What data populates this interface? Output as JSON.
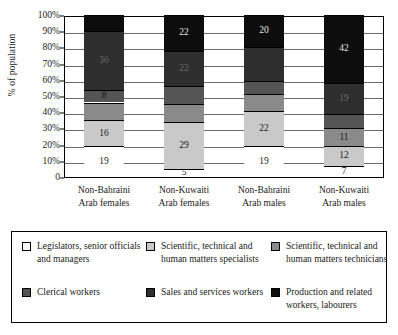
{
  "chart_data": {
    "type": "bar",
    "subtype": "100% stacked column",
    "title": "",
    "xlabel": "",
    "ylabel": "% of population",
    "ylim": [
      0,
      100
    ],
    "yticks": [
      "0",
      "10%",
      "20%",
      "30%",
      "40%",
      "50%",
      "60%",
      "70%",
      "80%",
      "90%",
      "100%"
    ],
    "ytick_values": [
      0,
      10,
      20,
      30,
      40,
      50,
      60,
      70,
      80,
      90,
      100
    ],
    "grid": true,
    "legend_position": "bottom",
    "categories": [
      "Non-Bahraini Arab females",
      "Non-Kuwaiti Arab females",
      "Non-Bahraini Arab males",
      "Non-Kuwaiti Arab males"
    ],
    "category_lines": [
      [
        "Non-Bahraini",
        "Arab females"
      ],
      [
        "Non-Kuwaiti",
        "Arab females"
      ],
      [
        "Non-Bahraini",
        "Arab males"
      ],
      [
        "Non-Kuwaiti",
        "Arab males"
      ]
    ],
    "series": [
      {
        "name": "Legislators, senior officials and managers",
        "color": "#ffffff",
        "label_color": "#1a1a1a",
        "values": [
          19,
          5,
          19,
          7
        ]
      },
      {
        "name": "Scientific, technical and human matters specialists",
        "color": "#c9c9c9",
        "label_color": "#1a1a1a",
        "values": [
          16,
          29,
          22,
          12
        ]
      },
      {
        "name": "Scientific, technical and human matters technicians",
        "color": "#8a8a8a",
        "label_color": "#1a1a1a",
        "values": [
          11,
          11,
          10,
          11
        ]
      },
      {
        "name": "Clerical workers",
        "color": "#545454",
        "label_color": "#1a1a1a",
        "values": [
          8,
          11,
          8,
          9
        ]
      },
      {
        "name": "Sales and services workers",
        "color": "#2e2e2e",
        "label_color": "#6a6a6a",
        "values": [
          36,
          22,
          21,
          19
        ]
      },
      {
        "name": "Production and related workers, labourers",
        "color": "#0d0d0d",
        "label_color": "#e8e8e8",
        "values": [
          10,
          22,
          20,
          42
        ]
      }
    ],
    "visible_value_labels": {
      "Non-Bahraini Arab females": {
        "Legislators, senior officials and managers": "19",
        "Scientific, technical and human matters specialists": "16",
        "Clerical workers": "8",
        "Sales and services workers": "36"
      },
      "Non-Kuwaiti Arab females": {
        "Legislators, senior officials and managers": "5",
        "Scientific, technical and human matters specialists": "29",
        "Sales and services workers": "22",
        "Production and related workers, labourers": "22"
      },
      "Non-Bahraini Arab males": {
        "Legislators, senior officials and managers": "19",
        "Scientific, technical and human matters specialists": "22",
        "Production and related workers, labourers": "20"
      },
      "Non-Kuwaiti Arab males": {
        "Legislators, senior officials and managers": "7",
        "Scientific, technical and human matters specialists": "12",
        "Scientific, technical and human matters technicians": "11",
        "Sales and services workers": "19",
        "Production and related workers, labourers": "42"
      }
    }
  },
  "legend": {
    "items": [
      {
        "label": "Legislators, senior officials and managers",
        "color": "#ffffff"
      },
      {
        "label": "Scientific, technical and human matters specialists",
        "color": "#c9c9c9"
      },
      {
        "label": "Scientific, technical and human matters technicians",
        "color": "#8a8a8a"
      },
      {
        "label": "Clerical workers",
        "color": "#545454"
      },
      {
        "label": "Sales and services workers",
        "color": "#2e2e2e"
      },
      {
        "label": "Production and related workers, labourers",
        "color": "#0d0d0d"
      }
    ]
  }
}
